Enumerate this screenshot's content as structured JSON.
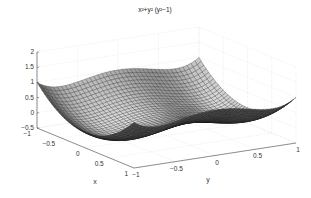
{
  "chart_data": {
    "type": "surface",
    "title_display": "x²+y² (y²−1)",
    "function": "z = x^2 + y^2*(y^2 - 1)",
    "xlabel": "x",
    "ylabel": "y",
    "zlabel": "",
    "xlim": [
      -1,
      1
    ],
    "ylim": [
      -1,
      1
    ],
    "zlim": [
      -0.5,
      2
    ],
    "xticks": [
      "-1",
      "-0.5",
      "0",
      "0.5",
      "1"
    ],
    "yticks": [
      "-1",
      "-0.5",
      "0",
      "0.5",
      "1"
    ],
    "zticks": [
      "-0.5",
      "0",
      "0.5",
      "1",
      "1.5",
      "2"
    ],
    "grid": true,
    "mesh_resolution": 41,
    "colormap": "gray",
    "samples": [
      {
        "x": -1,
        "y": -1,
        "z": 1
      },
      {
        "x": -1,
        "y": 0,
        "z": 1
      },
      {
        "x": 0,
        "y": 0,
        "z": 0
      },
      {
        "x": 0,
        "y": -0.707,
        "z": -0.25
      },
      {
        "x": 0,
        "y": 0.707,
        "z": -0.25
      },
      {
        "x": 1,
        "y": 1,
        "z": 1
      },
      {
        "x": -1,
        "y": 1,
        "z": 1
      },
      {
        "x": 1,
        "y": -1,
        "z": 1
      }
    ]
  },
  "colors": {
    "background": "#ffffff",
    "axis": "#444444",
    "grid": "#d8d8d8",
    "mesh_edge": "#111111"
  }
}
